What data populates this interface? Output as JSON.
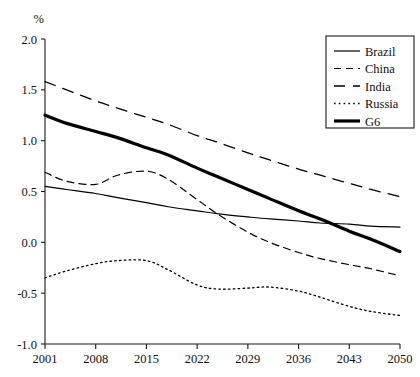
{
  "chart_data": {
    "type": "line",
    "title": "",
    "subtitle": "",
    "xlabel": "",
    "ylabel": "%",
    "unit_label": "%",
    "xlim": [
      2001,
      2050
    ],
    "ylim": [
      -1.0,
      2.0
    ],
    "grid": false,
    "legend_position": "top-right",
    "x_ticks": [
      "2001",
      "2008",
      "2015",
      "2022",
      "2029",
      "2036",
      "2043",
      "2050"
    ],
    "x_tick_values": [
      2001,
      2008,
      2015,
      2022,
      2029,
      2036,
      2043,
      2050
    ],
    "y_ticks": [
      "2.0",
      "1.5",
      "1.0",
      "0.5",
      "0.0",
      "-0.5",
      "-1.0"
    ],
    "y_tick_values": [
      2.0,
      1.5,
      1.0,
      0.5,
      0.0,
      -0.5,
      -1.0
    ],
    "x": [
      2001,
      2004,
      2008,
      2011,
      2015,
      2018,
      2022,
      2025,
      2029,
      2032,
      2036,
      2039,
      2043,
      2046,
      2050
    ],
    "series": [
      {
        "name": "Brazil",
        "style": "solid-thin",
        "color": "#000000",
        "values": [
          0.55,
          0.52,
          0.48,
          0.44,
          0.39,
          0.35,
          0.31,
          0.28,
          0.25,
          0.23,
          0.21,
          0.19,
          0.18,
          0.16,
          0.15
        ]
      },
      {
        "name": "China",
        "style": "dashed-short",
        "color": "#000000",
        "values": [
          0.69,
          0.6,
          0.57,
          0.66,
          0.7,
          0.62,
          0.42,
          0.27,
          0.1,
          0.0,
          -0.1,
          -0.16,
          -0.22,
          -0.26,
          -0.33
        ]
      },
      {
        "name": "India",
        "style": "dashed-long",
        "color": "#000000",
        "values": [
          1.58,
          1.5,
          1.39,
          1.32,
          1.23,
          1.16,
          1.05,
          0.98,
          0.88,
          0.81,
          0.72,
          0.66,
          0.58,
          0.52,
          0.45
        ]
      },
      {
        "name": "Russia",
        "style": "dotted",
        "color": "#000000",
        "values": [
          -0.35,
          -0.28,
          -0.21,
          -0.18,
          -0.18,
          -0.27,
          -0.42,
          -0.46,
          -0.45,
          -0.44,
          -0.48,
          -0.54,
          -0.63,
          -0.68,
          -0.72
        ]
      },
      {
        "name": "G6",
        "style": "solid-thick",
        "color": "#000000",
        "values": [
          1.25,
          1.17,
          1.09,
          1.03,
          0.93,
          0.86,
          0.73,
          0.64,
          0.52,
          0.43,
          0.31,
          0.23,
          0.11,
          0.03,
          -0.09
        ]
      }
    ]
  },
  "legend": {
    "entries": [
      {
        "label": "Brazil",
        "style": "solid-thin"
      },
      {
        "label": "China",
        "style": "dashed-short"
      },
      {
        "label": "India",
        "style": "dashed-long"
      },
      {
        "label": "Russia",
        "style": "dotted"
      },
      {
        "label": "G6",
        "style": "solid-thick"
      }
    ]
  }
}
